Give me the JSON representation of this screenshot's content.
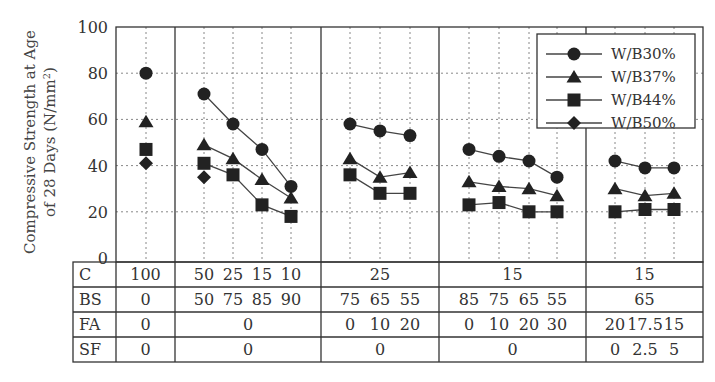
{
  "chart_data": {
    "type": "line",
    "title": "",
    "xlabel": "",
    "ylabel": "Compressive Strength at Age of 28 Days (N/mm²)",
    "ylabel_lines": [
      "Compressive Strength at Age",
      "of 28 Days (N/mm",
      "2",
      ")"
    ],
    "ylim": [
      0,
      100
    ],
    "yticks": [
      0,
      20,
      40,
      60,
      80,
      100
    ],
    "grid": true,
    "legend_position": "upper right",
    "legend": [
      "W/B30%",
      "W/B37%",
      "W/B44%",
      "W/B50%"
    ],
    "groups": [
      {
        "n": 1,
        "C": [
          "100"
        ],
        "BS": [
          "0"
        ],
        "FA": [
          "0"
        ],
        "SF": [
          "0"
        ]
      },
      {
        "n": 4,
        "C": [
          "50",
          "25",
          "15",
          "10"
        ],
        "BS": [
          "50",
          "75",
          "85",
          "90"
        ],
        "FA": [
          "0"
        ],
        "SF": [
          "0"
        ]
      },
      {
        "n": 3,
        "C": [
          "25"
        ],
        "BS": [
          "75",
          "65",
          "55"
        ],
        "FA": [
          "0",
          "10",
          "20"
        ],
        "SF": [
          "0"
        ]
      },
      {
        "n": 4,
        "C": [
          "15"
        ],
        "BS": [
          "85",
          "75",
          "65",
          "55"
        ],
        "FA": [
          "0",
          "10",
          "20",
          "30"
        ],
        "SF": [
          "0"
        ]
      },
      {
        "n": 3,
        "C": [
          "15"
        ],
        "BS": [
          "65"
        ],
        "FA": [
          "20",
          "17.5",
          "15"
        ],
        "SF": [
          "0",
          "2.5",
          "5"
        ]
      }
    ],
    "series": [
      {
        "name": "W/B30%",
        "marker": "circle",
        "groups": [
          [
            80
          ],
          [
            71,
            58,
            47,
            31
          ],
          [
            58,
            55,
            53
          ],
          [
            47,
            44,
            42,
            35
          ],
          [
            42,
            39,
            39
          ]
        ]
      },
      {
        "name": "W/B37%",
        "marker": "triangle",
        "groups": [
          [
            59
          ],
          [
            49,
            43,
            34,
            26
          ],
          [
            43,
            35,
            37
          ],
          [
            33,
            31,
            30,
            27
          ],
          [
            30,
            27,
            28
          ]
        ]
      },
      {
        "name": "W/B44%",
        "marker": "square",
        "groups": [
          [
            47
          ],
          [
            41,
            36,
            23,
            18
          ],
          [
            36,
            28,
            28
          ],
          [
            23,
            24,
            20,
            20
          ],
          [
            20,
            21,
            21
          ]
        ]
      },
      {
        "name": "W/B50%",
        "marker": "diamond",
        "groups": [
          [
            41
          ],
          [
            35
          ],
          [],
          [],
          []
        ]
      }
    ]
  },
  "table": {
    "row_labels": [
      "C",
      "BS",
      "FA",
      "SF"
    ]
  }
}
